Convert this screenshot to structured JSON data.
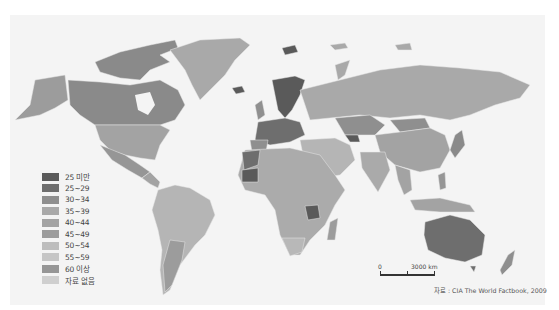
{
  "map": {
    "type": "choropleth",
    "subject": "world countries classified by value ranges",
    "colors": {
      "background": "#f4f4f4",
      "water": "#f4f4f4",
      "border": "#e6e6e6"
    }
  },
  "legend": {
    "items": [
      {
        "label": "25 미만",
        "color": "#5a5a5a"
      },
      {
        "label": "25~29",
        "color": "#6e6e6e"
      },
      {
        "label": "30~34",
        "color": "#8f8f8f"
      },
      {
        "label": "35~39",
        "color": "#a9a9a9"
      },
      {
        "label": "40~44",
        "color": "#a3a3a3"
      },
      {
        "label": "45~49",
        "color": "#9c9c9c"
      },
      {
        "label": "50~54",
        "color": "#bdbdbd"
      },
      {
        "label": "55~59",
        "color": "#c6c6c6"
      },
      {
        "label": "60 이상",
        "color": "#969696"
      },
      {
        "label": "자료 없음",
        "color": "#cfcfcf"
      }
    ]
  },
  "scale_bar": {
    "start_label": "0",
    "end_label": "3000 km"
  },
  "source": "자료 : CIA The World Factbook, 2009"
}
